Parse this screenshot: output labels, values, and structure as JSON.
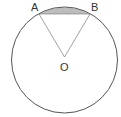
{
  "diagram": {
    "type": "circle-segment",
    "labels": {
      "A": "A",
      "B": "B",
      "O": "O"
    },
    "circle": {
      "cx": 64.5,
      "cy": 60,
      "r": 53
    },
    "points": {
      "A": {
        "x": 39,
        "y": 14
      },
      "B": {
        "x": 90,
        "y": 14
      },
      "O": {
        "x": 64.5,
        "y": 57
      }
    },
    "colors": {
      "stroke": "#555555",
      "segment_fill": "#bdbdbd",
      "radius_stroke": "#888888"
    }
  }
}
